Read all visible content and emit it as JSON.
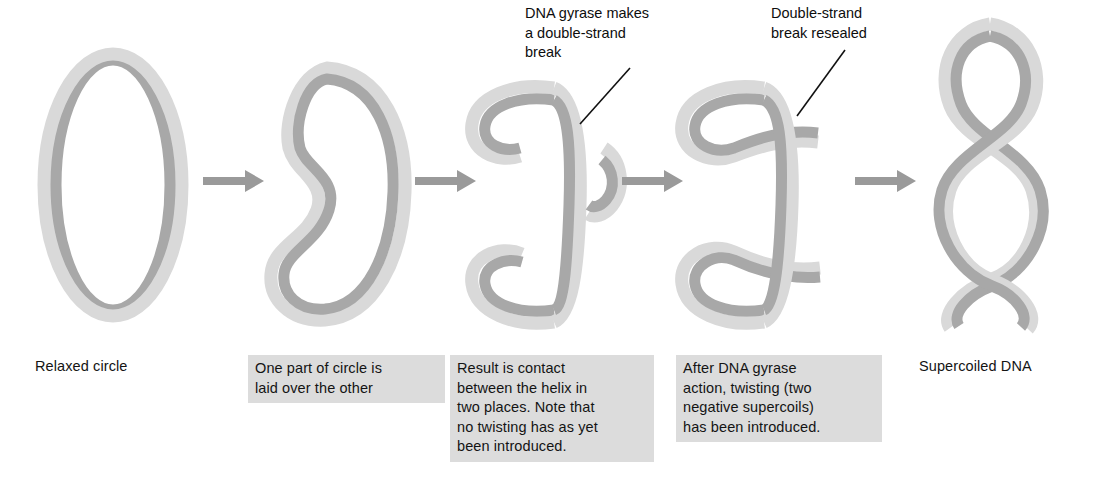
{
  "figure": {
    "background_color": "#ffffff",
    "ribbon_light_color": "#d9d9d9",
    "ribbon_dark_color": "#a8a8a8",
    "arrow_color": "#9a9a9a",
    "caption_box_color": "#dcdcdc",
    "text_color": "#141414",
    "leader_line_color": "#111111"
  },
  "annotations": [
    {
      "id": "gyrase-break-annotation",
      "text": "DNA gyrase makes\na double-strand\nbreak"
    },
    {
      "id": "break-resealed-annotation",
      "text": "Double-strand\nbreak resealed"
    }
  ],
  "stages": [
    {
      "id": "relaxed-circle",
      "shape": "ellipse-ribbon",
      "caption": "Relaxed circle",
      "boxed": false
    },
    {
      "id": "one-part-over-other",
      "shape": "s-curve-loop",
      "caption": "One part of circle is\nlaid over the other",
      "boxed": true
    },
    {
      "id": "contact-two-places",
      "shape": "crossed-loop-with-break",
      "caption": "Result is contact\nbetween the helix in\ntwo places. Note that\nno twisting has as yet\nbeen introduced.",
      "boxed": true
    },
    {
      "id": "gyrase-action-twisted",
      "shape": "figure-eight-resealed",
      "caption": "After DNA gyrase\naction, twisting (two\nnegative supercoils)\nhas been introduced.",
      "boxed": true
    },
    {
      "id": "supercoiled-dna",
      "shape": "twisted-supercoil",
      "caption": "Supercoiled DNA",
      "boxed": false
    }
  ],
  "arrows": [
    {
      "id": "arrow-1"
    },
    {
      "id": "arrow-2"
    },
    {
      "id": "arrow-3"
    },
    {
      "id": "arrow-4"
    }
  ]
}
